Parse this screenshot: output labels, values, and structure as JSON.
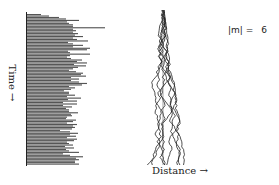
{
  "figure": {
    "y_axis_label": "Time →",
    "x_axis_label": "Distance →",
    "annotation_label": "|m| =",
    "annotation_value": "6"
  },
  "colors": {
    "bars": "#555555",
    "axis": "#222222",
    "walks": "#222222",
    "background": "#ffffff"
  },
  "chart_data": [
    {
      "type": "bar",
      "orientation": "horizontal",
      "title": "",
      "ylabel": "Time →",
      "xlabel": "",
      "grid": false,
      "values": [
        14,
        22,
        32,
        39,
        52,
        40,
        42,
        46,
        46,
        78,
        46,
        49,
        46,
        51,
        48,
        56,
        46,
        50,
        61,
        41,
        46,
        56,
        46,
        63,
        60,
        41,
        43,
        63,
        43,
        40,
        44,
        55,
        50,
        60,
        47,
        59,
        51,
        46,
        42,
        49,
        56,
        54,
        59,
        44,
        52,
        44,
        52,
        60,
        55,
        42,
        48,
        44,
        37,
        42,
        42,
        48,
        40,
        54,
        41,
        50,
        36,
        50,
        36,
        45,
        39,
        42,
        42,
        51,
        44,
        45,
        40,
        39,
        49,
        46,
        40,
        50,
        46,
        48,
        45,
        33,
        43,
        51,
        43,
        49,
        40,
        50,
        47,
        40,
        42,
        46,
        38,
        47,
        39,
        42,
        52,
        36,
        43,
        56,
        49,
        52,
        48,
        48,
        52
      ]
    },
    {
      "type": "line",
      "title": "Random walks",
      "xlabel": "Distance →",
      "ylabel": "",
      "grid": false,
      "annotation": "|m| = 6",
      "num_series": 8,
      "center_x": 0
    }
  ]
}
